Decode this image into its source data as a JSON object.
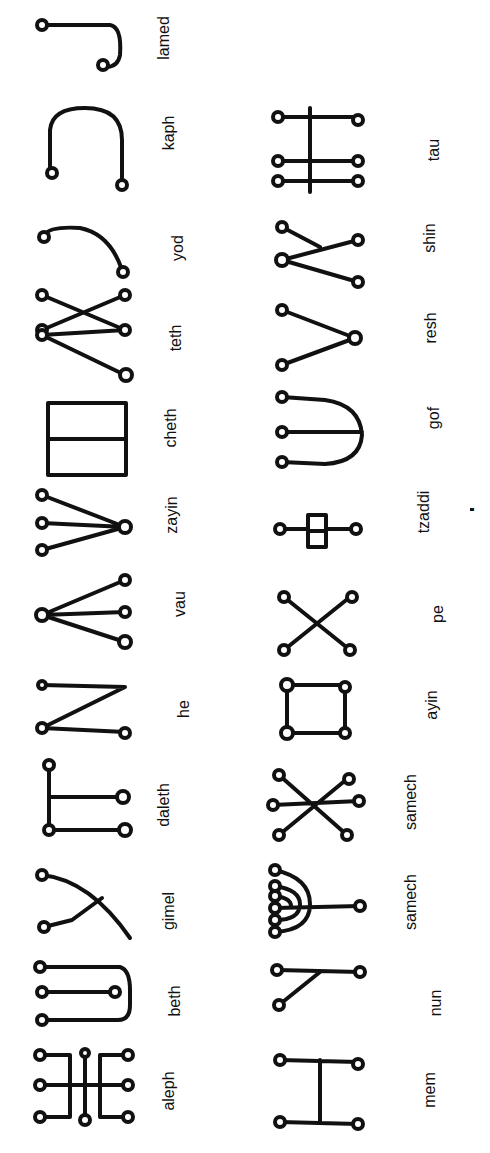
{
  "page": {
    "orientation": "rotated-90",
    "background": "#ffffff",
    "ink": "#111111"
  },
  "row1": {
    "letters": [
      {
        "name": "aleph"
      },
      {
        "name": "beth"
      },
      {
        "name": "gimel"
      },
      {
        "name": "daleth"
      },
      {
        "name": "he"
      },
      {
        "name": "vau"
      },
      {
        "name": "zayin"
      },
      {
        "name": "cheth"
      },
      {
        "name": "teth"
      },
      {
        "name": "yod"
      },
      {
        "name": "kaph"
      },
      {
        "name": "lamed"
      }
    ]
  },
  "row2": {
    "letters": [
      {
        "name": "mem"
      },
      {
        "name": "nun"
      },
      {
        "name": "samech"
      },
      {
        "name": "samech"
      },
      {
        "name": "ayin"
      },
      {
        "name": "pe"
      },
      {
        "name": "tzaddi"
      },
      {
        "name": "gof"
      },
      {
        "name": "resh"
      },
      {
        "name": "shin"
      },
      {
        "name": "tau"
      }
    ]
  },
  "caption": {
    "text": "Malachim Script"
  }
}
